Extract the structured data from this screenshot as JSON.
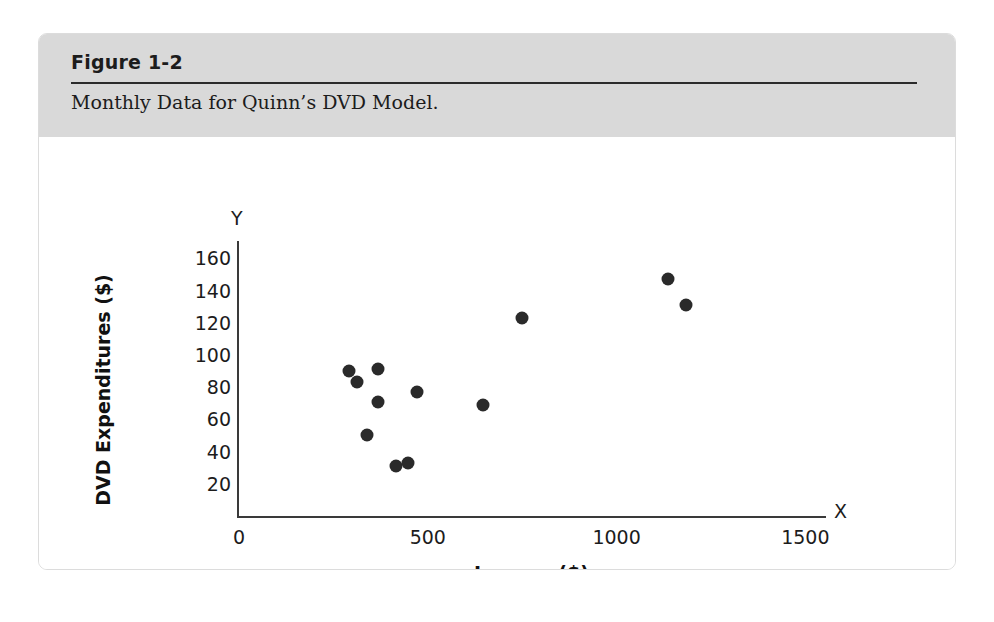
{
  "figure": {
    "number": "Figure 1-2",
    "caption": "Monthly Data for Quinn’s DVD Model."
  },
  "colors": {
    "header_band": "#d9d9d9",
    "point_fill": "#2a2a2a",
    "axis_line": "#3a3a3a",
    "card_border": "#dcdcdc"
  },
  "chart_data": {
    "type": "scatter",
    "title": "Monthly Data for Quinn’s DVD Model.",
    "xlabel": "Income ($)",
    "ylabel": "DVD Expenditures ($)",
    "x_axis_cap": "X",
    "y_axis_cap": "Y",
    "xlim": [
      0,
      1560
    ],
    "ylim": [
      0,
      172
    ],
    "xticks": [
      0,
      500,
      1000,
      1500
    ],
    "xtick_labels": [
      "0",
      "500",
      "1000",
      "1500"
    ],
    "yticks": [
      20,
      40,
      60,
      80,
      100,
      120,
      140,
      160
    ],
    "ytick_labels": [
      "20",
      "40",
      "60",
      "80",
      "100",
      "120",
      "140",
      "160"
    ],
    "grid": false,
    "legend": null,
    "points": [
      {
        "x": 292,
        "y": 90
      },
      {
        "x": 312,
        "y": 83
      },
      {
        "x": 368,
        "y": 91
      },
      {
        "x": 368,
        "y": 71
      },
      {
        "x": 338,
        "y": 50
      },
      {
        "x": 416,
        "y": 31
      },
      {
        "x": 447,
        "y": 33
      },
      {
        "x": 472,
        "y": 77
      },
      {
        "x": 645,
        "y": 69
      },
      {
        "x": 749,
        "y": 123
      },
      {
        "x": 1137,
        "y": 147
      },
      {
        "x": 1185,
        "y": 131
      }
    ]
  }
}
